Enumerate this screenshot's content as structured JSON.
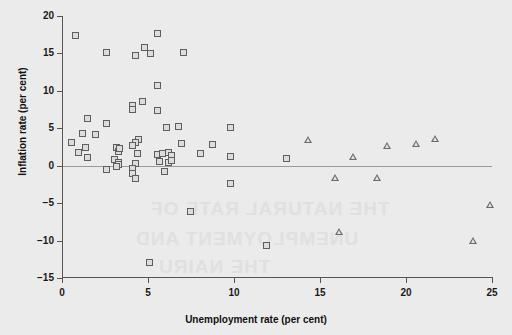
{
  "chart_data": {
    "type": "scatter",
    "title": "",
    "xlabel": "Unemployment rate (per cent)",
    "ylabel": "Inflation rate (per cent)",
    "xlim": [
      0,
      25
    ],
    "ylim": [
      -15,
      20
    ],
    "xticks": [
      0,
      5,
      10,
      15,
      20,
      25
    ],
    "yticks": [
      -15,
      -10,
      -5,
      0,
      5,
      10,
      15,
      20
    ],
    "xticklabels": [
      "0",
      "5",
      "10",
      "15",
      "20",
      "25"
    ],
    "yticklabels": [
      "−15",
      "−10",
      "−5",
      "0",
      "5",
      "10",
      "15",
      "20"
    ],
    "grid": false,
    "legend": "none",
    "zero_line": 0,
    "series": [
      {
        "name": "squares",
        "marker": "square",
        "points": [
          [
            0.8,
            17.3
          ],
          [
            2.6,
            15.0
          ],
          [
            4.3,
            14.6
          ],
          [
            4.8,
            15.7
          ],
          [
            5.2,
            14.9
          ],
          [
            5.6,
            17.6
          ],
          [
            7.1,
            15.0
          ],
          [
            5.6,
            10.7
          ],
          [
            4.1,
            8.0
          ],
          [
            4.1,
            7.5
          ],
          [
            4.7,
            8.5
          ],
          [
            5.6,
            7.3
          ],
          [
            1.5,
            6.2
          ],
          [
            2.6,
            5.6
          ],
          [
            6.1,
            5.1
          ],
          [
            6.8,
            5.2
          ],
          [
            9.8,
            5.0
          ],
          [
            0.6,
            3.0
          ],
          [
            1.2,
            4.2
          ],
          [
            2.0,
            4.1
          ],
          [
            4.5,
            3.4
          ],
          [
            4.3,
            3.0
          ],
          [
            4.1,
            2.7
          ],
          [
            7.0,
            2.9
          ],
          [
            8.8,
            2.8
          ],
          [
            1.0,
            1.7
          ],
          [
            1.4,
            2.3
          ],
          [
            1.5,
            1.0
          ],
          [
            3.2,
            2.4
          ],
          [
            3.3,
            1.8
          ],
          [
            3.4,
            2.2
          ],
          [
            4.4,
            1.5
          ],
          [
            5.6,
            1.4
          ],
          [
            5.9,
            1.5
          ],
          [
            6.2,
            1.7
          ],
          [
            6.4,
            1.3
          ],
          [
            8.1,
            1.5
          ],
          [
            9.8,
            1.2
          ],
          [
            13.1,
            0.9
          ],
          [
            3.1,
            0.8
          ],
          [
            3.3,
            0.4
          ],
          [
            3.3,
            0.1
          ],
          [
            4.3,
            0.2
          ],
          [
            5.7,
            0.5
          ],
          [
            6.2,
            0.4
          ],
          [
            6.4,
            0.6
          ],
          [
            2.6,
            -0.6
          ],
          [
            3.2,
            -0.2
          ],
          [
            4.1,
            -0.4
          ],
          [
            4.1,
            -1.1
          ],
          [
            4.3,
            -1.8
          ],
          [
            6.0,
            -0.9
          ],
          [
            9.8,
            -2.5
          ],
          [
            7.5,
            -6.2
          ],
          [
            5.1,
            -13.0
          ],
          [
            11.9,
            -10.7
          ]
        ]
      },
      {
        "name": "triangles",
        "marker": "triangle",
        "points": [
          [
            14.3,
            3.5
          ],
          [
            16.9,
            1.2
          ],
          [
            18.9,
            2.7
          ],
          [
            21.7,
            3.6
          ],
          [
            20.6,
            2.9
          ],
          [
            15.9,
            -1.6
          ],
          [
            18.3,
            -1.7
          ],
          [
            16.1,
            -8.8
          ],
          [
            23.9,
            -10.0
          ],
          [
            24.9,
            -5.2
          ]
        ]
      }
    ]
  },
  "watermark": {
    "line1": "THE NATURAL RATE OF",
    "line2": "UNEMPLOYMENT AND",
    "line3": "THE NAIRU"
  },
  "colors": {
    "background": "#ebebeb",
    "axis": "#555555",
    "zero_line": "#9a9a9a",
    "square_edge": "#5e5e5e",
    "square_fill": "#dcdcdc",
    "triangle": "#6a6a6a",
    "text": "#111111"
  }
}
